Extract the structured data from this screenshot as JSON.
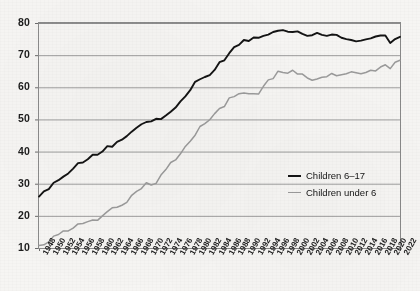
{
  "chart_data": {
    "type": "line",
    "title": "",
    "subtitle": "",
    "xlabel": "",
    "ylabel": "",
    "grid": true,
    "legend_position": "inside-right",
    "xlim": [
      1948,
      2022
    ],
    "ylim": [
      10,
      80
    ],
    "ytick_values": [
      10,
      20,
      30,
      40,
      50,
      60,
      70,
      80
    ],
    "ytick_labels": [
      "10",
      "20",
      "30",
      "40",
      "50",
      "60",
      "70",
      "80"
    ],
    "xtick_labels": [
      "1948",
      "1950",
      "1952",
      "1954",
      "1956",
      "1958",
      "1960",
      "1962",
      "1964",
      "1966",
      "1968",
      "1970",
      "1972",
      "1974",
      "1976",
      "1978",
      "1980",
      "1982",
      "1984",
      "1986",
      "1988",
      "1990",
      "1992",
      "1994",
      "1996",
      "1998",
      "2000",
      "2002",
      "2004",
      "2006",
      "2008",
      "2010",
      "2012",
      "2014",
      "2016",
      "2018",
      "2020",
      "2022"
    ],
    "x": [
      1948,
      1949,
      1950,
      1951,
      1952,
      1953,
      1954,
      1955,
      1956,
      1957,
      1958,
      1959,
      1960,
      1961,
      1962,
      1963,
      1964,
      1965,
      1966,
      1967,
      1968,
      1969,
      1970,
      1971,
      1972,
      1973,
      1974,
      1975,
      1976,
      1977,
      1978,
      1979,
      1980,
      1981,
      1982,
      1983,
      1984,
      1985,
      1986,
      1987,
      1988,
      1989,
      1990,
      1991,
      1992,
      1993,
      1994,
      1995,
      1996,
      1997,
      1998,
      1999,
      2000,
      2001,
      2002,
      2003,
      2004,
      2005,
      2006,
      2007,
      2008,
      2009,
      2010,
      2011,
      2012,
      2013,
      2014,
      2015,
      2016,
      2017,
      2018,
      2019,
      2020,
      2021,
      2022
    ],
    "series": [
      {
        "name": "Children 6–17",
        "color": "#141414",
        "values": [
          26.0,
          27.6,
          28.3,
          30.3,
          31.1,
          32.2,
          33.2,
          34.7,
          36.4,
          36.6,
          37.6,
          39.0,
          39.0,
          40.0,
          41.7,
          41.5,
          43.0,
          43.7,
          44.8,
          46.2,
          47.4,
          48.5,
          49.2,
          49.4,
          50.2,
          50.1,
          51.2,
          52.4,
          53.7,
          55.6,
          57.2,
          59.1,
          61.7,
          62.5,
          63.2,
          63.8,
          65.4,
          67.8,
          68.4,
          70.6,
          72.5,
          73.2,
          74.7,
          74.4,
          75.5,
          75.4,
          76.0,
          76.4,
          77.2,
          77.6,
          77.8,
          77.3,
          77.2,
          77.4,
          76.6,
          76.0,
          76.2,
          76.9,
          76.3,
          76.0,
          76.4,
          76.3,
          75.4,
          75.0,
          74.7,
          74.3,
          74.5,
          74.9,
          75.2,
          75.8,
          76.1,
          76.1,
          73.8,
          75.0,
          75.7
        ]
      },
      {
        "name": "Children under 6",
        "color": "#9b9b9b",
        "values": [
          10.8,
          11.0,
          11.9,
          13.7,
          14.2,
          15.3,
          15.3,
          16.2,
          17.5,
          17.6,
          18.2,
          18.7,
          18.6,
          20.0,
          21.3,
          22.5,
          22.7,
          23.3,
          24.2,
          26.4,
          27.6,
          28.5,
          30.3,
          29.6,
          30.1,
          32.7,
          34.4,
          36.6,
          37.4,
          39.3,
          41.6,
          43.2,
          45.1,
          47.8,
          48.7,
          49.9,
          51.8,
          53.4,
          54.0,
          56.7,
          57.1,
          58.0,
          58.2,
          58.0,
          58.0,
          57.9,
          60.3,
          62.3,
          62.7,
          65.0,
          64.6,
          64.4,
          65.3,
          64.1,
          64.1,
          62.9,
          62.2,
          62.6,
          63.1,
          63.3,
          64.3,
          63.6,
          63.9,
          64.2,
          64.8,
          64.5,
          64.2,
          64.6,
          65.3,
          65.1,
          66.3,
          67.0,
          65.8,
          67.8,
          68.4
        ]
      }
    ]
  },
  "legend": {
    "items": [
      {
        "label": "Children 6–17",
        "color": "#141414"
      },
      {
        "label": "Children under 6",
        "color": "#9b9b9b"
      }
    ]
  }
}
